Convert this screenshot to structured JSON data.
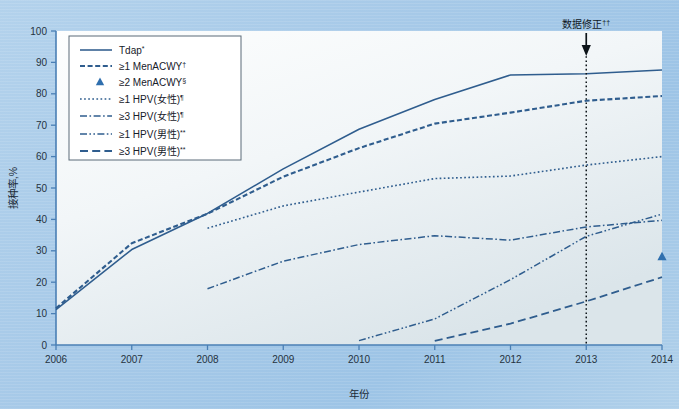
{
  "figure": {
    "background_color": "#a8cbe8",
    "plot_background_color": "#eef3f7",
    "line_color": "#2f5d8e",
    "accent_color": "#2f6fae",
    "annotation": {
      "label": "数据修正",
      "superscript": "††",
      "at_year": 2013,
      "icon": "down-arrow-icon"
    }
  },
  "chart_data": {
    "type": "line",
    "title": "",
    "xlabel": "年份",
    "ylabel": "接种率,%",
    "x": [
      2006,
      2007,
      2008,
      2009,
      2010,
      2011,
      2012,
      2013,
      2014
    ],
    "xlim": [
      2006,
      2014
    ],
    "ylim": [
      0,
      100
    ],
    "yticks": [
      0,
      10,
      20,
      30,
      40,
      50,
      60,
      70,
      80,
      90,
      100
    ],
    "xticks": [
      "2006",
      "2007",
      "2008",
      "2009",
      "2010",
      "2011",
      "2012",
      "2013",
      "2014"
    ],
    "grid": false,
    "legend_position": "top-left",
    "series": [
      {
        "name": "Tdap",
        "superscript": "*",
        "style": "solid",
        "x": [
          2006,
          2007,
          2008,
          2009,
          2010,
          2011,
          2012,
          2013,
          2014
        ],
        "values": [
          11.3,
          30.4,
          41.9,
          56.1,
          68.7,
          78.2,
          86.0,
          86.4,
          87.6
        ]
      },
      {
        "name": "≥1 MenACWY",
        "superscript": "†",
        "style": "dotted",
        "x": [
          2006,
          2007,
          2008,
          2009,
          2010,
          2011,
          2012,
          2013,
          2014
        ],
        "values": [
          11.7,
          32.4,
          41.8,
          53.6,
          62.7,
          70.5,
          74.0,
          77.8,
          79.3
        ]
      },
      {
        "name": "≥2 MenACWY",
        "superscript": "§",
        "style": "marker-triangle",
        "x": [
          2014
        ],
        "values": [
          28.1
        ]
      },
      {
        "name": "≥1 HPV(女性)",
        "superscript": "¶",
        "style": "fine-dotted",
        "x": [
          2008,
          2009,
          2010,
          2011,
          2012,
          2013,
          2014
        ],
        "values": [
          37.2,
          44.3,
          48.7,
          53.0,
          53.8,
          57.3,
          60.0
        ]
      },
      {
        "name": "≥3 HPV(女性)",
        "superscript": "¶",
        "style": "dash-dot",
        "x": [
          2008,
          2009,
          2010,
          2011,
          2012,
          2013,
          2014
        ],
        "values": [
          17.9,
          26.7,
          32.0,
          34.8,
          33.4,
          37.6,
          39.7
        ]
      },
      {
        "name": "≥1 HPV(男性)",
        "superscript": "**",
        "style": "dash-dot-dot",
        "x": [
          2010,
          2011,
          2012,
          2013,
          2014
        ],
        "values": [
          1.4,
          8.3,
          20.8,
          34.6,
          41.7
        ]
      },
      {
        "name": "≥3 HPV(男性)",
        "superscript": "**",
        "style": "dashed",
        "x": [
          2011,
          2012,
          2013,
          2014
        ],
        "values": [
          1.3,
          6.8,
          13.9,
          21.6
        ]
      }
    ]
  }
}
